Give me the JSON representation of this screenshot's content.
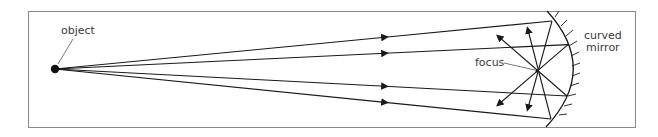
{
  "diagram": {
    "labels": {
      "object": "object",
      "focus": "focus",
      "mirror_line1": "curved",
      "mirror_line2": "mirror"
    },
    "colors": {
      "line": "#1a1a1a",
      "frame": "#8a8a8a",
      "text": "#3a3a3a"
    },
    "elements": {
      "object_point": "object-dot",
      "incident_rays": 4,
      "reflected_rays": 4,
      "mirror_type": "concave curved mirror"
    }
  }
}
